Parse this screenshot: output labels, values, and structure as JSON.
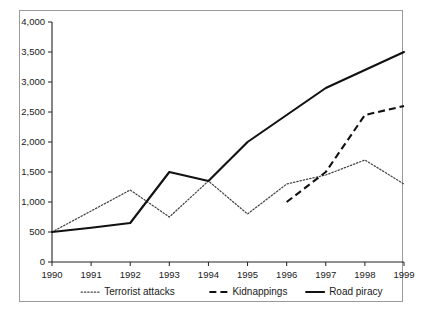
{
  "chart_data": {
    "type": "line",
    "title": "",
    "subtitle": "",
    "xlabel": "",
    "ylabel": "",
    "categories": [
      "1990",
      "1991",
      "1992",
      "1993",
      "1994",
      "1995",
      "1996",
      "1997",
      "1998",
      "1999"
    ],
    "xlim": [
      1990,
      1999
    ],
    "ylim": [
      0,
      4000
    ],
    "ytick_labels": [
      "0",
      "500",
      "1,000",
      "1,500",
      "2,000",
      "2,500",
      "3,000",
      "3,500",
      "4,000"
    ],
    "ytick_values": [
      0,
      500,
      1000,
      1500,
      2000,
      2500,
      3000,
      3500,
      4000
    ],
    "grid": false,
    "legend_position": "bottom",
    "series": [
      {
        "name": "Terrorist attacks",
        "style": "dotted",
        "color": "#444444",
        "x": [
          "1990",
          "1991",
          "1992",
          "1993",
          "1994",
          "1995",
          "1996",
          "1997",
          "1998",
          "1999"
        ],
        "values": [
          500,
          850,
          1200,
          750,
          1350,
          800,
          1300,
          1450,
          1700,
          1300
        ]
      },
      {
        "name": "Kidnappings",
        "style": "dashed",
        "color": "#111111",
        "x": [
          "1996",
          "1997",
          "1998",
          "1999"
        ],
        "values": [
          1000,
          1500,
          2450,
          2600
        ]
      },
      {
        "name": "Road piracy",
        "style": "solid",
        "color": "#111111",
        "x": [
          "1990",
          "1991",
          "1992",
          "1993",
          "1994",
          "1995",
          "1996",
          "1997",
          "1998",
          "1999"
        ],
        "values": [
          500,
          570,
          650,
          1500,
          1350,
          2000,
          2450,
          2900,
          3200,
          3500
        ]
      }
    ]
  },
  "legend": {
    "items": [
      {
        "label": "Terrorist attacks",
        "style": "dotted"
      },
      {
        "label": "Kidnappings",
        "style": "dashed"
      },
      {
        "label": "Road piracy",
        "style": "solid"
      }
    ]
  }
}
